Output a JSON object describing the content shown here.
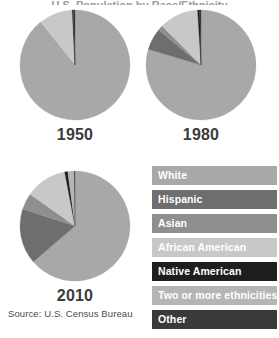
{
  "title_clipped": "U.S. Population by Race/Ethnicity",
  "source": "Source: U.S. Census Bureau",
  "legend": {
    "items": [
      {
        "label": "White",
        "color": "#a8a8a8",
        "text_color": "#ffffff"
      },
      {
        "label": "Hispanic",
        "color": "#6e6e6e",
        "text_color": "#ffffff"
      },
      {
        "label": "Asian",
        "color": "#8f8f8f",
        "text_color": "#ffffff"
      },
      {
        "label": "African American",
        "color": "#c8c8c8",
        "text_color": "#ffffff"
      },
      {
        "label": "Native American",
        "color": "#1e1e1e",
        "text_color": "#ffffff"
      },
      {
        "label": "Two or more ethnicities",
        "color": "#b5b5b5",
        "text_color": "#ffffff"
      },
      {
        "label": "Other",
        "color": "#3a3a3a",
        "text_color": "#ffffff"
      }
    ]
  },
  "chart_data": {
    "type": "pie",
    "title": "U.S. Population by Race/Ethnicity",
    "source": "Source: U.S. Census Bureau",
    "legend_position": "right",
    "categories": [
      "White",
      "Hispanic",
      "Asian",
      "African American",
      "Native American",
      "Two or more ethnicities",
      "Other"
    ],
    "colors": [
      "#a8a8a8",
      "#6e6e6e",
      "#8f8f8f",
      "#c8c8c8",
      "#1e1e1e",
      "#b5b5b5",
      "#3a3a3a"
    ],
    "charts": [
      {
        "label": "1950",
        "values": [
          89.0,
          0.0,
          0.2,
          10.0,
          0.3,
          0.0,
          0.5
        ],
        "slices": [
          {
            "name": "White",
            "value": 89.0,
            "color": "#a8a8a8"
          },
          {
            "name": "Hispanic",
            "value": 0.0,
            "color": "#6e6e6e"
          },
          {
            "name": "Asian",
            "value": 0.2,
            "color": "#8f8f8f"
          },
          {
            "name": "African American",
            "value": 10.0,
            "color": "#c8c8c8"
          },
          {
            "name": "Native American",
            "value": 0.3,
            "color": "#1e1e1e"
          },
          {
            "name": "Two or more ethnicities",
            "value": 0.0,
            "color": "#b5b5b5"
          },
          {
            "name": "Other",
            "value": 0.5,
            "color": "#3a3a3a"
          }
        ]
      },
      {
        "label": "1980",
        "values": [
          79.6,
          6.4,
          1.5,
          11.5,
          0.6,
          0.0,
          0.4
        ],
        "slices": [
          {
            "name": "White",
            "value": 79.6,
            "color": "#a8a8a8"
          },
          {
            "name": "Hispanic",
            "value": 6.4,
            "color": "#6e6e6e"
          },
          {
            "name": "Asian",
            "value": 1.5,
            "color": "#8f8f8f"
          },
          {
            "name": "African American",
            "value": 11.5,
            "color": "#c8c8c8"
          },
          {
            "name": "Native American",
            "value": 0.6,
            "color": "#1e1e1e"
          },
          {
            "name": "Two or more ethnicities",
            "value": 0.0,
            "color": "#b5b5b5"
          },
          {
            "name": "Other",
            "value": 0.4,
            "color": "#3a3a3a"
          }
        ]
      },
      {
        "label": "2010",
        "values": [
          63.7,
          16.3,
          4.8,
          12.2,
          0.9,
          1.9,
          0.2
        ],
        "slices": [
          {
            "name": "White",
            "value": 63.7,
            "color": "#a8a8a8"
          },
          {
            "name": "Hispanic",
            "value": 16.3,
            "color": "#6e6e6e"
          },
          {
            "name": "Asian",
            "value": 4.8,
            "color": "#8f8f8f"
          },
          {
            "name": "African American",
            "value": 12.2,
            "color": "#c8c8c8"
          },
          {
            "name": "Native American",
            "value": 0.9,
            "color": "#1e1e1e"
          },
          {
            "name": "Two or more ethnicities",
            "value": 1.9,
            "color": "#b5b5b5"
          },
          {
            "name": "Other",
            "value": 0.2,
            "color": "#3a3a3a"
          }
        ]
      }
    ]
  },
  "geometry": {
    "pies": [
      {
        "cx": 75,
        "cy": 65,
        "r": 55
      },
      {
        "cx": 201,
        "cy": 65,
        "r": 55
      },
      {
        "cx": 75,
        "cy": 226,
        "r": 55
      }
    ],
    "label_y_offsets": [
      126,
      126,
      287
    ]
  }
}
